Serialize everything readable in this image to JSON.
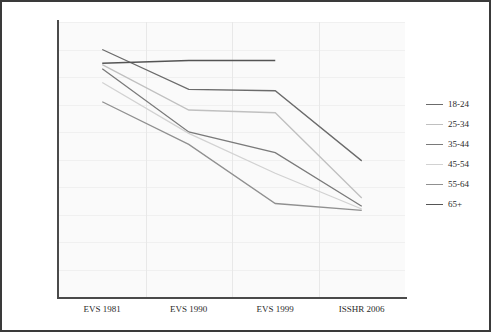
{
  "chart_data": {
    "type": "line",
    "title": "",
    "subtitle": "",
    "xlabel": "",
    "ylabel": "",
    "categories": [
      "EVS 1981",
      "EVS 1990",
      "EVS 1999",
      "ISSHR 2006"
    ],
    "ylim": [
      0,
      100
    ],
    "yticks": [
      "0%",
      "10%",
      "20%",
      "30%",
      "40%",
      "50%",
      "60%",
      "70%",
      "80%",
      "90%",
      "100%"
    ],
    "ytick_values": [
      0,
      10,
      20,
      30,
      40,
      50,
      60,
      70,
      80,
      90,
      100
    ],
    "grid": true,
    "legend_position": "right",
    "unit": "%",
    "series": [
      {
        "name": "18-24",
        "color": "#6b6b6b",
        "values": [
          90,
          75.5,
          75,
          49.5
        ]
      },
      {
        "name": "25-34",
        "color": "#c0c0c0",
        "values": [
          84.5,
          68,
          67,
          36
        ]
      },
      {
        "name": "35-44",
        "color": "#7a7a7a",
        "values": [
          83,
          60,
          52.5,
          33
        ]
      },
      {
        "name": "45-54",
        "color": "#d2d2d2",
        "values": [
          78,
          59.5,
          45,
          32
        ]
      },
      {
        "name": "55-64",
        "color": "#909090",
        "values": [
          71,
          55.5,
          34,
          31.5
        ]
      },
      {
        "name": "65+",
        "color": "#555555",
        "values": [
          85,
          86,
          86,
          null
        ]
      }
    ]
  },
  "legend": {
    "entries": [
      {
        "label": "18-24"
      },
      {
        "label": "25-34"
      },
      {
        "label": "35-44"
      },
      {
        "label": "45-54"
      },
      {
        "label": "55-64"
      },
      {
        "label": "65+"
      }
    ]
  }
}
